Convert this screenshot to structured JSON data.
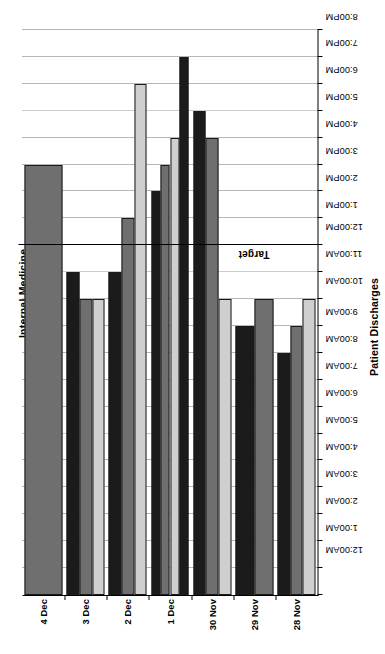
{
  "chart_data": {
    "type": "bar",
    "orientation": "horizontal",
    "title": "Internal Medicine",
    "subtitle": "Team #1  Week #6",
    "xlabel": "Patient Discharges",
    "ylabel": "Time of Day",
    "grid": true,
    "legend": "none",
    "axis_rotation_degrees": -90,
    "value_axis": {
      "label": "Time of Day",
      "tick_labels": [
        "12:00AM",
        "1:00AM",
        "2:00AM",
        "3:00AM",
        "4:00AM",
        "5:00AM",
        "6:00AM",
        "7:00AM",
        "8:00AM",
        "9:00AM",
        "10:00AM",
        "11:00AM",
        "12:00PM",
        "1:00PM",
        "2:00PM",
        "3:00PM",
        "4:00PM",
        "5:00PM",
        "6:00PM",
        "7:00PM",
        "8:00PM",
        "9:00PM"
      ],
      "min_hour": 0,
      "max_hour": 21
    },
    "category_axis": {
      "label": "Patient Discharges",
      "categories": [
        "28 Nov",
        "29 Nov",
        "30 Nov",
        "1 Dec",
        "2 Dec",
        "3 Dec",
        "4 Dec"
      ]
    },
    "target": {
      "label": "Target",
      "hour": 13,
      "time_label": "1:00PM",
      "color": "#000000"
    },
    "series_colors": [
      "#1b1b1b",
      "#6f6f6f",
      "#cfcfcf"
    ],
    "groups": [
      {
        "category": "28 Nov",
        "bars": [
          {
            "series": 0,
            "hour": 9,
            "time_label": "9:00AM"
          },
          {
            "series": 1,
            "hour": 10,
            "time_label": "10:00AM"
          },
          {
            "series": 2,
            "hour": 11,
            "time_label": "11:00AM"
          }
        ]
      },
      {
        "category": "29 Nov",
        "bars": [
          {
            "series": 0,
            "hour": 10,
            "time_label": "10:00AM"
          },
          {
            "series": 1,
            "hour": 11,
            "time_label": "11:00AM"
          }
        ]
      },
      {
        "category": "30 Nov",
        "bars": [
          {
            "series": 0,
            "hour": 18,
            "time_label": "6:00PM"
          },
          {
            "series": 1,
            "hour": 17,
            "time_label": "5:00PM"
          },
          {
            "series": 2,
            "hour": 11,
            "time_label": "11:00AM"
          }
        ]
      },
      {
        "category": "1 Dec",
        "bars": [
          {
            "series": 0,
            "hour": 15,
            "time_label": "3:00PM"
          },
          {
            "series": 1,
            "hour": 16,
            "time_label": "4:00PM"
          },
          {
            "series": 2,
            "hour": 17,
            "time_label": "5:00PM"
          },
          {
            "series": 0,
            "hour": 20,
            "time_label": "8:00PM"
          }
        ]
      },
      {
        "category": "2 Dec",
        "bars": [
          {
            "series": 0,
            "hour": 12,
            "time_label": "12:00PM"
          },
          {
            "series": 1,
            "hour": 14,
            "time_label": "2:00PM"
          },
          {
            "series": 2,
            "hour": 19,
            "time_label": "7:00PM"
          }
        ]
      },
      {
        "category": "3 Dec",
        "bars": [
          {
            "series": 0,
            "hour": 12,
            "time_label": "12:00PM"
          },
          {
            "series": 1,
            "hour": 11,
            "time_label": "11:00AM"
          },
          {
            "series": 2,
            "hour": 11,
            "time_label": "11:00AM"
          }
        ]
      },
      {
        "category": "4 Dec",
        "bars": [
          {
            "series": 1,
            "hour": 16,
            "time_label": "4:00PM"
          }
        ]
      }
    ]
  }
}
